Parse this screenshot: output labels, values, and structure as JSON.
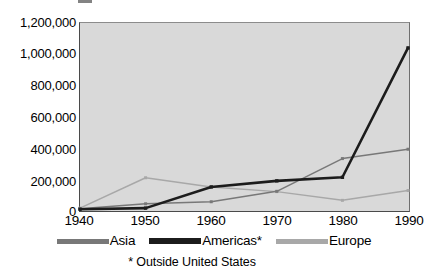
{
  "chart_data": {
    "type": "line",
    "title": "",
    "xlabel": "",
    "ylabel": "",
    "x": [
      1940,
      1950,
      1960,
      1970,
      1980,
      1990
    ],
    "categories": [
      "1940",
      "1950",
      "1960",
      "1970",
      "1980",
      "1990"
    ],
    "xlim": [
      1940,
      1990
    ],
    "ylim": [
      0,
      1200000
    ],
    "grid": false,
    "legend_position": "bottom",
    "y_ticks": [
      0,
      200000,
      400000,
      600000,
      800000,
      1000000,
      1200000
    ],
    "y_tick_labels": [
      "0",
      "200,000",
      "400,000",
      "600,000",
      "800,000",
      "1,000,000",
      "1,200,000"
    ],
    "x_tick_labels": [
      "1940",
      "1950",
      "1960",
      "1970",
      "1980",
      "1990"
    ],
    "series": [
      {
        "name": "Asia",
        "color": "#787878",
        "values": [
          8000,
          40000,
          53000,
          120000,
          330000,
          390000
        ]
      },
      {
        "name": "Americas*",
        "color": "#1c1c1c",
        "values": [
          5000,
          12000,
          148000,
          187000,
          210000,
          1040000
        ]
      },
      {
        "name": "Europe",
        "color": "#a8a8a8",
        "values": [
          12000,
          207000,
          148000,
          118000,
          62000,
          125000
        ]
      }
    ],
    "annotations": [
      "* Outside United States"
    ]
  },
  "legend": {
    "items": [
      {
        "label": "Asia",
        "color": "#787878"
      },
      {
        "label": "Americas*",
        "color": "#1c1c1c"
      },
      {
        "label": "Europe",
        "color": "#a8a8a8"
      }
    ]
  },
  "footnote": "* Outside United States",
  "axis": {
    "y_labels": [
      "1,200,000",
      "1,000,000",
      "800,000",
      "600,000",
      "400,000",
      "200,000",
      "0"
    ],
    "x_labels": [
      "1940",
      "1950",
      "1960",
      "1970",
      "1980",
      "1990"
    ]
  },
  "colors": {
    "plot_background": "#d9d9d9",
    "page_background": "#ffffff",
    "axis": "#4a4a4a",
    "text": "#000000"
  }
}
